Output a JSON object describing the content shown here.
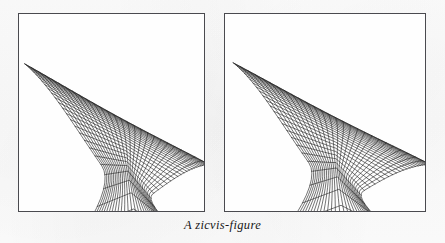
{
  "figure": {
    "caption": "A zicvis-figure",
    "background_color": "#fdfdfd",
    "frame_color": "#4a4a4f",
    "line_color": "#1d1d1d",
    "panel_count": 2
  },
  "panels": [
    {
      "id": "left",
      "name": "zicvis-panel-left",
      "label": "left wireframe panel",
      "frame": {
        "x": 18,
        "y": 13,
        "width": 187,
        "height": 199
      },
      "mesh": {
        "type": "parametric-wireframe",
        "u_lines": 27,
        "v_lines": 27,
        "cusp_strength": 0.62,
        "cusp_x": 0.6,
        "cusp_y": 0.8,
        "fan_top_x": 0.035,
        "fan_top_y": 0.255
      }
    },
    {
      "id": "right",
      "name": "zicvis-panel-right",
      "label": "right wireframe panel",
      "frame": {
        "x": 224,
        "y": 13,
        "width": 202,
        "height": 199
      },
      "mesh": {
        "type": "parametric-wireframe",
        "u_lines": 27,
        "v_lines": 27,
        "cusp_strength": 0.92,
        "cusp_x": 0.56,
        "cusp_y": 0.78,
        "fan_top_x": 0.045,
        "fan_top_y": 0.25
      }
    }
  ],
  "chart_data": {
    "type": "line",
    "title": "A zicvis-figure",
    "subtitle": "",
    "xlabel": "",
    "ylabel": "",
    "grid": false,
    "legend": "none",
    "series": [
      {
        "name": "u-family (left panel)",
        "count": 27
      },
      {
        "name": "v-family (left panel)",
        "count": 27
      },
      {
        "name": "u-family (right panel)",
        "count": 27
      },
      {
        "name": "v-family (right panel)",
        "count": 27
      }
    ]
  }
}
